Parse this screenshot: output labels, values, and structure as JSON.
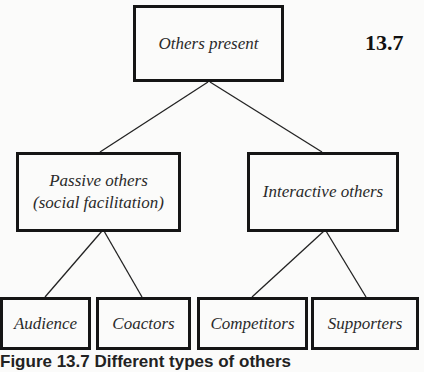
{
  "figure": {
    "number": "13.7",
    "caption": "Figure 13.7 Different types of others"
  },
  "tree": {
    "root": {
      "label": "Others present"
    },
    "branches": [
      {
        "label_line1": "Passive others",
        "label_line2": "(social facilitation)",
        "children": [
          {
            "label": "Audience"
          },
          {
            "label": "Coactors"
          }
        ]
      },
      {
        "label_line1": "Interactive others",
        "children": [
          {
            "label": "Competitors"
          },
          {
            "label": "Supporters"
          }
        ]
      }
    ]
  }
}
